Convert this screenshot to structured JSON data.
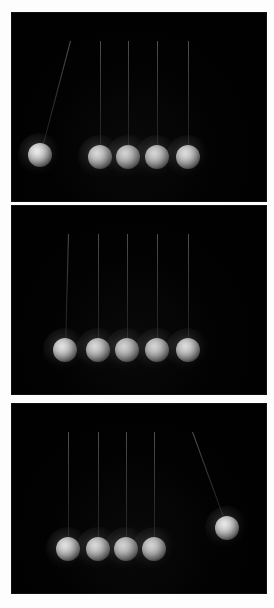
{
  "figure": {
    "frame_count": 3,
    "background_color": "#010101",
    "border_color": "#ffffff",
    "ball_color": "#e8e8e8",
    "string_color": "#8a8a8a",
    "canvas": {
      "width": 274,
      "height": 608
    }
  },
  "frames": [
    {
      "id": "frame-1",
      "label": "Frame 1 - left ball released",
      "top": 13,
      "height": 188,
      "pivot_y": 28,
      "ball_radius": 12,
      "balls": [
        {
          "name": "ball-1",
          "cx": 28,
          "cy": 142,
          "state": "swung-left",
          "has_string": true,
          "pivot_x": 58,
          "angle_deg": -34
        },
        {
          "name": "ball-2",
          "cx": 88,
          "cy": 144,
          "state": "at-rest",
          "has_string": true,
          "pivot_x": 88,
          "angle_deg": 0
        },
        {
          "name": "ball-3",
          "cx": 116,
          "cy": 144,
          "state": "at-rest",
          "has_string": true,
          "pivot_x": 116,
          "angle_deg": 0
        },
        {
          "name": "ball-4",
          "cx": 145,
          "cy": 144,
          "state": "at-rest",
          "has_string": true,
          "pivot_x": 145,
          "angle_deg": 0
        },
        {
          "name": "ball-5",
          "cx": 176,
          "cy": 144,
          "state": "at-rest",
          "has_string": true,
          "pivot_x": 176,
          "angle_deg": 0
        }
      ]
    },
    {
      "id": "frame-2",
      "label": "Frame 2 - all balls at rest in contact",
      "top": 206,
      "height": 188,
      "pivot_y": 28,
      "ball_radius": 12,
      "balls": [
        {
          "name": "ball-1",
          "cx": 53,
          "cy": 144,
          "state": "at-rest",
          "has_string": true,
          "pivot_x": 56,
          "angle_deg": -1
        },
        {
          "name": "ball-2",
          "cx": 86,
          "cy": 144,
          "state": "at-rest",
          "has_string": true,
          "pivot_x": 86,
          "angle_deg": 0
        },
        {
          "name": "ball-3",
          "cx": 115,
          "cy": 144,
          "state": "at-rest",
          "has_string": true,
          "pivot_x": 115,
          "angle_deg": 0
        },
        {
          "name": "ball-4",
          "cx": 145,
          "cy": 144,
          "state": "at-rest",
          "has_string": true,
          "pivot_x": 145,
          "angle_deg": 0
        },
        {
          "name": "ball-5",
          "cx": 176,
          "cy": 144,
          "state": "at-rest",
          "has_string": true,
          "pivot_x": 176,
          "angle_deg": 0
        }
      ]
    },
    {
      "id": "frame-3",
      "label": "Frame 3 - right ball swung out",
      "top": 404,
      "height": 189,
      "pivot_y": 28,
      "ball_radius": 12,
      "balls": [
        {
          "name": "ball-1",
          "cx": 56,
          "cy": 145,
          "state": "at-rest",
          "has_string": true,
          "pivot_x": 56,
          "angle_deg": 0
        },
        {
          "name": "ball-2",
          "cx": 86,
          "cy": 145,
          "state": "at-rest",
          "has_string": true,
          "pivot_x": 86,
          "angle_deg": 0
        },
        {
          "name": "ball-3",
          "cx": 114,
          "cy": 145,
          "state": "at-rest",
          "has_string": true,
          "pivot_x": 114,
          "angle_deg": 0
        },
        {
          "name": "ball-4",
          "cx": 142,
          "cy": 145,
          "state": "at-rest",
          "has_string": true,
          "pivot_x": 142,
          "angle_deg": 0
        },
        {
          "name": "ball-5",
          "cx": 215,
          "cy": 124,
          "state": "swung-right",
          "has_string": true,
          "pivot_x": 180,
          "angle_deg": 34
        }
      ]
    }
  ]
}
